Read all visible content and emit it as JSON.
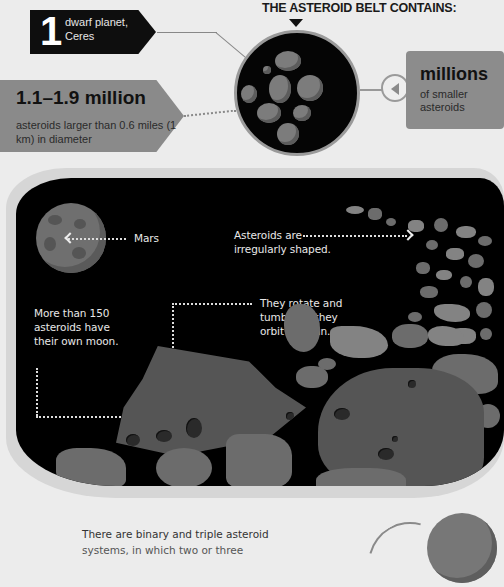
{
  "header": {
    "title": "THE ASTEROID BELT CONTAINS:"
  },
  "callouts": {
    "ceres": {
      "number": "1",
      "text_line1": "dwarf planet,",
      "text_line2": "Ceres"
    },
    "large_asteroids": {
      "title": "1.1–1.9 million",
      "desc": "asteroids larger than 0.6 miles (1 km) in diameter"
    },
    "small_asteroids": {
      "title": "millions",
      "desc": "of smaller asteroids"
    }
  },
  "space_panel": {
    "mars_label": "Mars",
    "irregular_label": "Asteroids are irregularly shaped.",
    "rotate_label": "They rotate and tumble as they orbit the Sun.",
    "moon_label": "More than 150 asteroids have their own moon."
  },
  "footer": {
    "text_line1": "There are binary and triple asteroid",
    "text_line2": "systems, in which two or three"
  },
  "icons": {
    "play_button": "left-triangle-icon",
    "down_arrow": "triangle-down-icon"
  },
  "colors": {
    "background": "#ececec",
    "space": "#000000",
    "callout_dark": "#0e0e0e",
    "callout_gray": "#8a8a8a"
  }
}
